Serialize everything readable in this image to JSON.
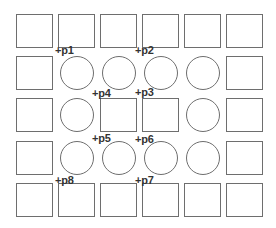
{
  "diagram": {
    "grid": {
      "columns": 6,
      "rows": 5,
      "col_x": [
        16,
        58,
        100,
        142,
        184,
        226
      ],
      "row_y": [
        14,
        56,
        98,
        141,
        183
      ],
      "rect_size": [
        37,
        34
      ],
      "circle_size": [
        34,
        34
      ],
      "stroke_color": "#6e6e6e",
      "layout": [
        [
          "rect",
          "rect",
          "rect",
          "rect",
          "rect",
          "rect"
        ],
        [
          "rect",
          "circle",
          "circle",
          "circle",
          "circle",
          "rect"
        ],
        [
          "rect",
          "circle",
          "rect",
          "rect",
          "circle",
          "rect"
        ],
        [
          "rect",
          "circle",
          "circle",
          "circle",
          "circle",
          "rect"
        ],
        [
          "rect",
          "rect",
          "rect",
          "rect",
          "rect",
          "rect"
        ]
      ]
    },
    "points": [
      {
        "label": "+p1",
        "x": 55,
        "y": 45
      },
      {
        "label": "+p2",
        "x": 135,
        "y": 45
      },
      {
        "label": "+p3",
        "x": 135,
        "y": 87
      },
      {
        "label": "+p4",
        "x": 92,
        "y": 88
      },
      {
        "label": "+p5",
        "x": 92,
        "y": 133
      },
      {
        "label": "+p6",
        "x": 135,
        "y": 134
      },
      {
        "label": "+p7",
        "x": 135,
        "y": 175
      },
      {
        "label": "+p8",
        "x": 55,
        "y": 175
      }
    ]
  }
}
